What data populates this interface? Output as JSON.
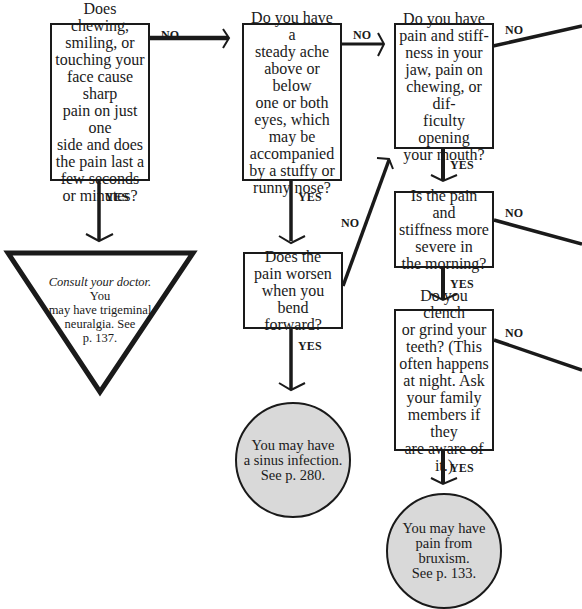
{
  "diagram": {
    "type": "flowchart",
    "questions": [
      {
        "id": "q1",
        "text": "Does chewing,\nsmiling, or\ntouching your\nface cause sharp\npain on just one\nside and does\nthe pain last a\nfew seconds\nor minutes?"
      },
      {
        "id": "q2",
        "text": "Do you have a\nsteady ache\nabove or below\none or both\neyes, which\nmay be\naccompanied\nby a stuffy or\nrunny nose?"
      },
      {
        "id": "q3",
        "text": "Do you have\npain and stiff-\nness in your\njaw, pain on\nchewing, or dif-\nficulty opening\nyour mouth?"
      },
      {
        "id": "q4",
        "text": "Does the\npain worsen\nwhen you\nbend forward?"
      },
      {
        "id": "q5",
        "text": "Is the pain and\nstiffness more\nsevere in\nthe morning?"
      },
      {
        "id": "q6",
        "text": "Do you clench\nor grind your\nteeth? (This\noften happens\nat night. Ask\nyour family\nmembers if they\nare aware of it.)"
      }
    ],
    "urgent_outcome": {
      "italic_lead": "Consult your doctor.",
      "text": " You\nmay have trigeminal\nneuralgia. See\np. 137."
    },
    "outcomes": [
      {
        "id": "sinus",
        "text": "You may have\na sinus infection.\nSee p. 280."
      },
      {
        "id": "bruxism",
        "text": "You may have\npain from bruxism.\nSee p. 133."
      }
    ],
    "labels": {
      "yes": "YES",
      "no": "NO"
    },
    "colors": {
      "line": "#1a1a1a",
      "outcome_fill": "#d9d9d9",
      "background": "#ffffff"
    }
  }
}
